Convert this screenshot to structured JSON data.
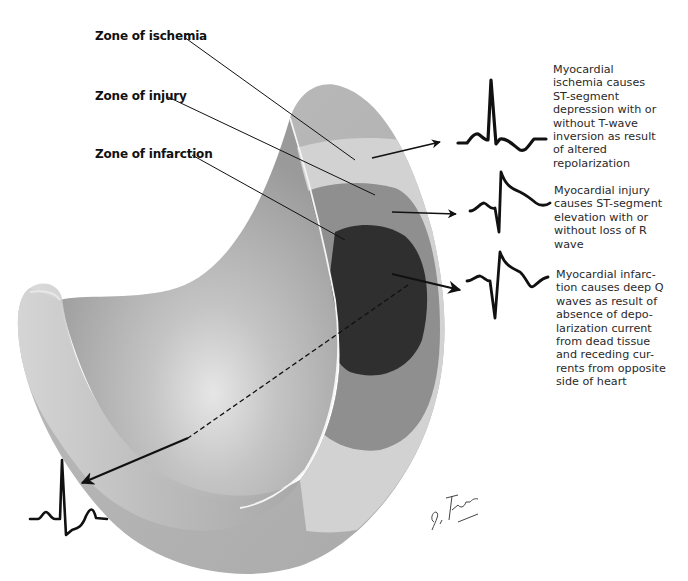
{
  "labels": {
    "ischemia": "Zone of ischemia",
    "injury": "Zone of injury",
    "infarction": "Zone of infarction"
  },
  "descriptions": {
    "ischemia": [
      "Myocardial",
      "ischemia causes",
      "ST-segment",
      "depression with or",
      "without T-wave",
      "inversion as result",
      "of altered",
      "repolarization"
    ],
    "injury": [
      "Myocardial injury",
      "causes ST-segment",
      "elevation with or",
      "without loss of R",
      "wave"
    ],
    "infarction": [
      "Myocardial infarc-",
      "tion causes deep Q",
      "waves as result of",
      "absence of depo-",
      "larization current",
      "from dead tissue",
      "and receding cur-",
      "rents from opposite",
      "side of heart"
    ]
  },
  "ecg_traces": [
    {
      "name": "ischemia-trace",
      "pattern": "ST depression with T-wave inversion"
    },
    {
      "name": "injury-trace",
      "pattern": "ST elevation"
    },
    {
      "name": "infarction-trace",
      "pattern": "deep Q wave with ST elevation"
    },
    {
      "name": "opposite-side-trace",
      "pattern": "normal/reciprocal complex"
    }
  ],
  "colors": {
    "wall_base": "#b9b9b9",
    "ischemia_zone": "#d0d0d0",
    "injury_zone": "#8f8f8f",
    "infarction_zone": "#2e2e2e",
    "ink": "#111111"
  },
  "signature": "F. Netter M.D."
}
